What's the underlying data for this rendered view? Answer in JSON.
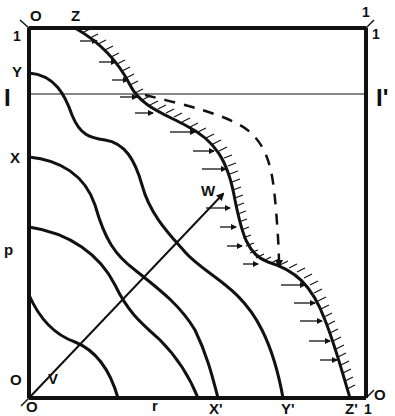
{
  "diagram": {
    "labels": {
      "top_left_O": "O",
      "top_Z": "Z",
      "top_right_1": "1",
      "right_corner_1": "1",
      "left_1": "1",
      "left_Y": "Y",
      "left_I": "I",
      "right_I_prime": "I'",
      "left_X": "X",
      "left_p": "p",
      "bottom_left_O": "O",
      "origin_V": "V",
      "below_O": "O",
      "bottom_r": "r",
      "bottom_X_prime": "X'",
      "bottom_Y_prime": "Y'",
      "bottom_Z_prime": "Z'",
      "bottom_right_1": "1",
      "bottom_right_O": "O",
      "arrow_W": "W"
    },
    "colors": {
      "ink": "#111111",
      "background": "#ffffff"
    },
    "curves": [
      {
        "name": "Y-to-Y-prime",
        "start": "Y",
        "end": "Y'"
      },
      {
        "name": "X-to-X-prime",
        "start": "X",
        "end": "X'"
      },
      {
        "name": "third-contour",
        "start": "p-upper",
        "end": "r-middle"
      },
      {
        "name": "fourth-contour",
        "start": "p-lower",
        "end": "r-left"
      },
      {
        "name": "boundary-Z-to-Z-prime",
        "start": "Z",
        "end": "Z'",
        "hatched": true,
        "arrows": "inward-right"
      },
      {
        "name": "dashed-path",
        "style": "dashed",
        "ends_with_arrow": true
      }
    ],
    "vector": {
      "from": "V",
      "to": "W"
    },
    "horizontal_line": {
      "left": "I",
      "right": "I'"
    }
  }
}
